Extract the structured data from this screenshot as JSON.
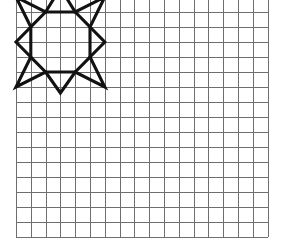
{
  "page": {
    "background_color": "#ffffff",
    "width": 283,
    "height": 252
  },
  "grid": {
    "name": "square-grid-paper",
    "columns": 17,
    "rows": 16,
    "cell_width": 14.8,
    "cell_height": 15.0,
    "origin_x": 16,
    "origin_y": -3,
    "line_color": "#6f6f72",
    "faint_line_color": "#bdbdc1",
    "line_width": 1
  },
  "figure": {
    "name": "eight-pointed-star",
    "stroke_color": "#121212",
    "stroke_width": 3.1,
    "fill": "none",
    "bounds_cells": {
      "col_start": 0,
      "col_end": 6,
      "row_start": 0,
      "row_end": 6
    },
    "outer_points_cells": [
      [
        3,
        -0.6
      ],
      [
        6,
        0
      ],
      [
        6,
        3
      ],
      [
        6,
        6
      ],
      [
        3,
        6.4
      ],
      [
        0,
        6
      ],
      [
        0,
        3
      ],
      [
        0,
        0
      ]
    ],
    "inner_core_cells": [
      [
        2,
        1
      ],
      [
        4,
        1
      ],
      [
        5,
        2
      ],
      [
        5,
        4
      ],
      [
        4,
        5
      ],
      [
        2,
        5
      ],
      [
        1,
        4
      ],
      [
        1,
        2
      ]
    ]
  }
}
